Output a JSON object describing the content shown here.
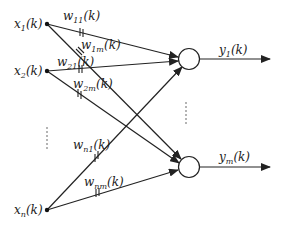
{
  "diagram": {
    "type": "single-layer neural network",
    "inputs": [
      {
        "id": "x1",
        "base": "x",
        "sub": "1",
        "arg": "(k)",
        "label": "x1(k)",
        "x": 47,
        "y": 24
      },
      {
        "id": "x2",
        "base": "x",
        "sub": "2",
        "arg": "(k)",
        "label": "x2(k)",
        "x": 47,
        "y": 71
      },
      {
        "id": "xn",
        "base": "x",
        "sub": "n",
        "arg": "(k)",
        "label": "xn(k)",
        "x": 47,
        "y": 210
      }
    ],
    "outputs": [
      {
        "id": "y1",
        "base": "y",
        "sub": "1",
        "arg": "(k)",
        "label": "y1(k)",
        "cx": 189,
        "cy": 59
      },
      {
        "id": "ym",
        "base": "y",
        "sub": "m",
        "arg": "(k)",
        "label": "ym(k)",
        "cx": 189,
        "cy": 167
      }
    ],
    "weights": [
      {
        "id": "w11",
        "base": "w",
        "sub": "11",
        "arg": "(k)",
        "label": "w11(k)",
        "from": "x1",
        "to": "y1"
      },
      {
        "id": "w1m",
        "base": "w",
        "sub": "1m",
        "arg": "(k)",
        "label": "w1m(k)",
        "from": "x1",
        "to": "ym"
      },
      {
        "id": "w21",
        "base": "w",
        "sub": "21",
        "arg": "(k)",
        "label": "w21(k)",
        "from": "x2",
        "to": "y1"
      },
      {
        "id": "w2m",
        "base": "w",
        "sub": "2m",
        "arg": "(k)",
        "label": "w2m(k)",
        "from": "x2",
        "to": "ym"
      },
      {
        "id": "wn1",
        "base": "w",
        "sub": "n1",
        "arg": "(k)",
        "label": "wn1(k)",
        "from": "xn",
        "to": "y1"
      },
      {
        "id": "wnm",
        "base": "w",
        "sub": "nm",
        "arg": "(k)",
        "label": "wnm(k)",
        "from": "xn",
        "to": "ym"
      }
    ],
    "ellipsis_inputs": "⋮",
    "ellipsis_outputs": "⋮",
    "colors": {
      "stroke": "#222222",
      "background": "#ffffff"
    }
  }
}
